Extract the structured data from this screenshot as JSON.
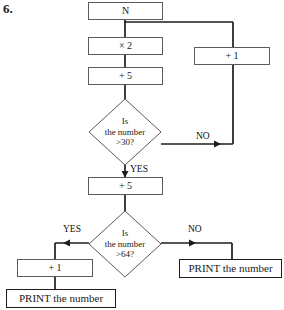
{
  "question": {
    "number": "6."
  },
  "diagram": {
    "type": "flowchart",
    "nodes": [
      {
        "id": "start",
        "kind": "process",
        "label": "N"
      },
      {
        "id": "times2",
        "kind": "process",
        "label": "× 2"
      },
      {
        "id": "plus5a",
        "kind": "process",
        "label": "+ 5"
      },
      {
        "id": "decision30",
        "kind": "decision",
        "line1": "Is",
        "line2": "the number",
        "line3": ">30?"
      },
      {
        "id": "plus1right",
        "kind": "process",
        "label": "+ 1"
      },
      {
        "id": "plus5b",
        "kind": "process",
        "label": "+ 5"
      },
      {
        "id": "decision64",
        "kind": "decision",
        "line1": "Is",
        "line2": "the number",
        "line3": ">64?"
      },
      {
        "id": "plus1left",
        "kind": "process",
        "label": "+ 1"
      },
      {
        "id": "printleft",
        "kind": "terminal",
        "label": "PRINT the number"
      },
      {
        "id": "printright",
        "kind": "terminal",
        "label": "PRINT the number"
      }
    ],
    "edge_labels": {
      "decision30_no": "NO",
      "decision30_yes": "YES",
      "decision64_yes": "YES",
      "decision64_no": "NO"
    },
    "colors": {
      "box_stroke": "#5b5b5b",
      "wire": "#1d1d1d",
      "text": "#1a1a1a",
      "background": "#ffffff"
    }
  }
}
